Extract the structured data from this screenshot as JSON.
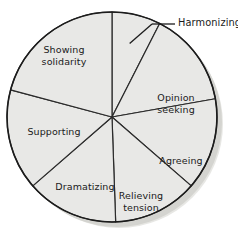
{
  "chart_data": {
    "type": "pie",
    "title": "",
    "subtitle": "",
    "xlabel": "",
    "ylabel": "",
    "legend_position": "none",
    "grid": false,
    "units": "degrees",
    "total_degrees": 360,
    "categories": [
      "Harmonizing",
      "Opinion seeking",
      "Agreeing",
      "Relieving tension",
      "Dramatizing",
      "Supporting",
      "Showing solidarity"
    ],
    "values": [
      27,
      53,
      51,
      47,
      51,
      56,
      75
    ],
    "slices": [
      {
        "label": "Harmonizing",
        "label_lines": "Harmonizing",
        "value": 27,
        "start_angle": 90,
        "end_angle": 63,
        "label_placement": "external",
        "leader_line": true
      },
      {
        "label": "Opinion seeking",
        "label_lines": "Opinion\nseeking",
        "value": 53,
        "start_angle": 63,
        "end_angle": 10,
        "label_placement": "internal",
        "leader_line": false
      },
      {
        "label": "Agreeing",
        "label_lines": "Agreeing",
        "value": 51,
        "start_angle": 10,
        "end_angle": -41,
        "label_placement": "internal",
        "leader_line": false
      },
      {
        "label": "Relieving tension",
        "label_lines": "Relieving\ntension",
        "value": 47,
        "start_angle": -41,
        "end_angle": -88,
        "label_placement": "internal",
        "leader_line": false
      },
      {
        "label": "Dramatizing",
        "label_lines": "Dramatizing",
        "value": 51,
        "start_angle": -88,
        "end_angle": -139,
        "label_placement": "internal",
        "leader_line": false
      },
      {
        "label": "Supporting",
        "label_lines": "Supporting",
        "value": 56,
        "start_angle": -139,
        "end_angle": -195,
        "label_placement": "internal",
        "leader_line": false
      },
      {
        "label": "Showing solidarity",
        "label_lines": "Showing\nsolidarity",
        "value": 75,
        "start_angle": 165,
        "end_angle": 90,
        "label_placement": "internal",
        "leader_line": false
      }
    ],
    "colors": {
      "slice_fill": "#e8e8e6",
      "slice_stroke": "#2b2b2b",
      "outline": "#1c1c1c",
      "shadow": "#b9b9b4",
      "label_text": "#1a1a1a",
      "leader_line": "#1c1c1c",
      "background": "#ffffff"
    },
    "geometry": {
      "center_x": 112,
      "center_y": 117,
      "radius": 105
    }
  }
}
